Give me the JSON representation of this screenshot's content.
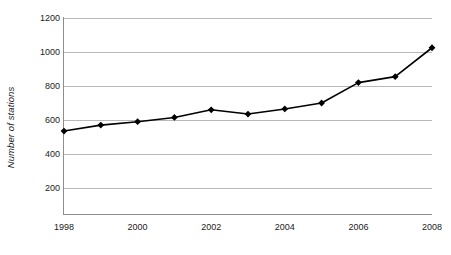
{
  "chart_data": {
    "type": "line",
    "title": "",
    "xlabel": "",
    "ylabel": "Number of stations",
    "xlim": [
      1998,
      2008
    ],
    "ylim": [
      0,
      1200
    ],
    "grid": "horizontal",
    "legend": "none",
    "marker": "diamond",
    "line_color": "#000000",
    "marker_color": "#000000",
    "grid_color": "#b9b9b9",
    "axis_color": "#8e8e8e",
    "x": [
      1998,
      1999,
      2000,
      2001,
      2002,
      2003,
      2004,
      2005,
      2006,
      2007,
      2008
    ],
    "values": [
      535,
      570,
      590,
      615,
      660,
      635,
      665,
      700,
      820,
      855,
      1025
    ],
    "y_ticks": [
      200,
      400,
      600,
      800,
      1000,
      1200
    ],
    "y_tick_labels": [
      "200",
      "400",
      "600",
      "800",
      "1000",
      "1200"
    ],
    "x_ticks": [
      1998,
      2000,
      2002,
      2004,
      2006,
      2008
    ],
    "x_tick_labels": [
      "1998",
      "2000",
      "2002",
      "2004",
      "2006",
      "2008"
    ]
  }
}
